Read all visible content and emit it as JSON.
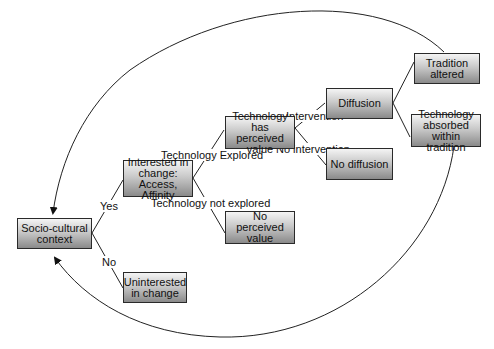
{
  "diagram": {
    "nodes": [
      {
        "id": "socio_cultural",
        "label": "Socio-cultural context"
      },
      {
        "id": "interested",
        "label": "Interested in change: Access, Affinity"
      },
      {
        "id": "uninterested",
        "label": "Uninterested in change"
      },
      {
        "id": "perceived_value",
        "label": "Technology has perceived value"
      },
      {
        "id": "no_perceived_value",
        "label": "No perceived value"
      },
      {
        "id": "diffusion",
        "label": "Diffusion"
      },
      {
        "id": "no_diffusion",
        "label": "No diffusion"
      },
      {
        "id": "tradition_altered",
        "label": "Tradition altered"
      },
      {
        "id": "absorbed",
        "label": "Technology absorbed within tradition"
      }
    ],
    "edge_labels": {
      "yes": "Yes",
      "no": "No",
      "explored": "Technology Explored",
      "not_explored": "Technology not explored",
      "intervention": "Intervention",
      "no_intervention": "No intervention"
    },
    "edges": [
      {
        "from": "socio_cultural",
        "to": "interested",
        "label": "Yes"
      },
      {
        "from": "socio_cultural",
        "to": "uninterested",
        "label": "No"
      },
      {
        "from": "interested",
        "to": "perceived_value",
        "label": "Technology Explored"
      },
      {
        "from": "interested",
        "to": "no_perceived_value",
        "label": "Technology not explored"
      },
      {
        "from": "perceived_value",
        "to": "diffusion",
        "label": "Intervention"
      },
      {
        "from": "perceived_value",
        "to": "no_diffusion",
        "label": "No intervention"
      },
      {
        "from": "diffusion",
        "to": "tradition_altered",
        "label": ""
      },
      {
        "from": "diffusion",
        "to": "absorbed",
        "label": ""
      },
      {
        "from": "tradition_altered",
        "to": "socio_cultural",
        "label": "",
        "style": "curved-arrow-top"
      },
      {
        "from": "absorbed",
        "to": "socio_cultural",
        "label": "",
        "style": "curved-arrow-bottom"
      }
    ]
  }
}
